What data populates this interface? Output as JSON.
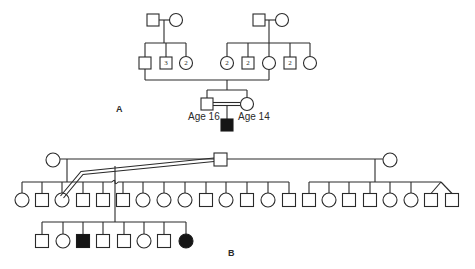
{
  "figure": {
    "type": "pedigree",
    "panels": [
      "A",
      "B"
    ]
  },
  "panel_a": {
    "label": "A",
    "proband_father_age": "Age 16",
    "proband_mother_age": "Age 14",
    "left_grandparents": {
      "children": [
        {
          "sex": "male",
          "count": "",
          "affected": false
        },
        {
          "sex": "male",
          "count": "3",
          "affected": false
        },
        {
          "sex": "female",
          "count": "2",
          "affected": false
        }
      ]
    },
    "right_grandparents": {
      "children": [
        {
          "sex": "female",
          "count": "2",
          "affected": false
        },
        {
          "sex": "male",
          "count": "2",
          "affected": false
        },
        {
          "sex": "female",
          "count": "",
          "affected": false
        },
        {
          "sex": "male",
          "count": "2",
          "affected": false
        },
        {
          "sex": "female",
          "count": "",
          "affected": false
        }
      ]
    },
    "consanguineous_couple": {
      "male_age": "Age 16",
      "female_age": "Age 14"
    },
    "proband": {
      "sex": "male",
      "affected": true
    }
  },
  "panel_b": {
    "label": "B",
    "generation_ii_left_sibship": [
      "female",
      "male",
      "female",
      "male",
      "male",
      "male",
      "female",
      "female",
      "female",
      "male",
      "female",
      "male",
      "female",
      "male"
    ],
    "generation_ii_right_sibship": [
      "male",
      "female",
      "male",
      "male",
      "female",
      "female",
      "male-twin",
      "male-twin"
    ],
    "generation_iii": [
      {
        "sex": "male",
        "affected": false
      },
      {
        "sex": "female",
        "affected": false
      },
      {
        "sex": "male",
        "affected": true
      },
      {
        "sex": "male",
        "affected": false
      },
      {
        "sex": "male",
        "affected": false
      },
      {
        "sex": "female",
        "affected": false
      },
      {
        "sex": "male",
        "affected": false
      },
      {
        "sex": "female",
        "affected": true
      }
    ]
  },
  "colors": {
    "line": "#2a2a2a",
    "affected_fill": "#151515",
    "background": "#ffffff"
  }
}
